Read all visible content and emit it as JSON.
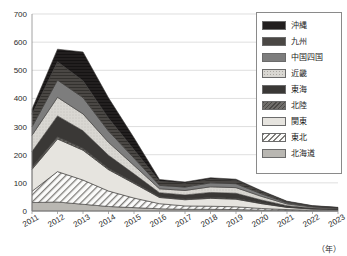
{
  "chart_data": {
    "type": "area",
    "stacked": true,
    "title": "",
    "xlabel": "(年)",
    "ylabel": "",
    "ylim": [
      0,
      700
    ],
    "ytick_step": 100,
    "yticks": [
      "0",
      "100",
      "200",
      "300",
      "400",
      "500",
      "600",
      "700"
    ],
    "grid": true,
    "legend_position": "top-right",
    "categories": [
      "2011",
      "2012",
      "2013",
      "2014",
      "2015",
      "2016",
      "2017",
      "2018",
      "2019",
      "2020",
      "2021",
      "2022",
      "2023"
    ],
    "series": [
      {
        "name": "北海道",
        "values": [
          30,
          32,
          24,
          16,
          12,
          8,
          6,
          6,
          5,
          3,
          2,
          1,
          1
        ]
      },
      {
        "name": "東北",
        "values": [
          40,
          108,
          86,
          55,
          34,
          18,
          12,
          11,
          10,
          6,
          3,
          2,
          1
        ]
      },
      {
        "name": "関東",
        "values": [
          78,
          116,
          106,
          76,
          52,
          22,
          22,
          28,
          27,
          17,
          8,
          4,
          3
        ]
      },
      {
        "name": "北陸",
        "values": [
          8,
          8,
          7,
          5,
          4,
          3,
          3,
          3,
          3,
          2,
          1,
          1,
          1
        ]
      },
      {
        "name": "東海",
        "values": [
          55,
          74,
          62,
          46,
          30,
          14,
          14,
          18,
          18,
          11,
          5,
          3,
          2
        ]
      },
      {
        "name": "近畿",
        "values": [
          58,
          66,
          60,
          46,
          30,
          14,
          16,
          20,
          20,
          13,
          6,
          3,
          2
        ]
      },
      {
        "name": "中国四国",
        "values": [
          30,
          61,
          58,
          40,
          26,
          12,
          12,
          14,
          14,
          9,
          4,
          2,
          1
        ]
      },
      {
        "name": "九州",
        "values": [
          45,
          65,
          60,
          46,
          30,
          15,
          14,
          13,
          12,
          8,
          4,
          2,
          1
        ]
      },
      {
        "name": "沖縄",
        "values": [
          18,
          45,
          102,
          72,
          42,
          6,
          4,
          5,
          4,
          3,
          2,
          1,
          1
        ]
      }
    ],
    "totals": [
      362,
      575,
      565,
      402,
      260,
      112,
      103,
      118,
      113,
      72,
      35,
      19,
      13
    ]
  },
  "legend": {
    "items": [
      {
        "label": "沖縄",
        "swatch": "sw-okinawa",
        "icon": "legend-swatch-okinawa"
      },
      {
        "label": "九州",
        "swatch": "sw-kyushu",
        "icon": "legend-swatch-kyushu"
      },
      {
        "label": "中国四国",
        "swatch": "sw-chugoku",
        "icon": "legend-swatch-chugoku-shikoku"
      },
      {
        "label": "近畿",
        "swatch": "sw-kinki",
        "icon": "legend-swatch-kinki"
      },
      {
        "label": "東海",
        "swatch": "sw-tokai",
        "icon": "legend-swatch-tokai"
      },
      {
        "label": "北陸",
        "swatch": "sw-hokuriku",
        "icon": "legend-swatch-hokuriku"
      },
      {
        "label": "関東",
        "swatch": "sw-kanto",
        "icon": "legend-swatch-kanto"
      },
      {
        "label": "東北",
        "swatch": "sw-tohoku",
        "icon": "legend-swatch-tohoku"
      },
      {
        "label": "北海道",
        "swatch": "sw-hokkaido",
        "icon": "legend-swatch-hokkaido"
      }
    ]
  },
  "axis": {
    "unit": "（年）"
  },
  "colors": {
    "okinawa": "#221f1f",
    "kyushu": "#4a4744",
    "chugoku_shikoku": "#7d7d7d",
    "kinki": "#d9d7d2",
    "tokai": "#3a3836",
    "hokuriku": "#6f6d6a",
    "kanto": "#e6e4df",
    "tohoku": "#fbfbfa",
    "hokkaido": "#b9b7b2",
    "grid": "#d0d0d0",
    "axis": "#8a8a8a",
    "text": "#2b2b2b"
  }
}
